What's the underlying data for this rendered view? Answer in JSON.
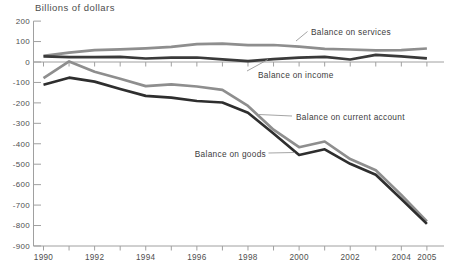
{
  "colors": {
    "background": "#ffffff",
    "axis": "#a0a0a0",
    "tick_label": "#4f4f4f",
    "title_text": "#4d4d4d",
    "annotation_text": "#3d3d3d",
    "pointer_line": "#9a9a9a"
  },
  "chart_data": {
    "type": "line",
    "title": "Billions of dollars",
    "xlabel": "",
    "ylabel": "Billions of dollars",
    "x": [
      1990,
      1991,
      1992,
      1993,
      1994,
      1995,
      1996,
      1997,
      1998,
      1999,
      2000,
      2001,
      2002,
      2003,
      2004,
      2005
    ],
    "x_tick_labels": [
      "1990",
      "1992",
      "1994",
      "1996",
      "1998",
      "2000",
      "2002",
      "2004",
      "2005"
    ],
    "y_tick_labels": [
      "200",
      "100",
      "0",
      "-100",
      "-200",
      "-300",
      "-400",
      "-500",
      "-600",
      "-700",
      "-800",
      "-900"
    ],
    "xlim": [
      1990,
      2005
    ],
    "ylim": [
      -900,
      200
    ],
    "grid": false,
    "zero_baseline": true,
    "legend_position": "inline-annotations",
    "series": [
      {
        "id": "balance-on-services",
        "name": "Balance on services",
        "color": "#8e8e8e",
        "values": [
          30,
          46,
          58,
          62,
          67,
          74,
          87,
          90,
          82,
          83,
          75,
          64,
          61,
          57,
          58,
          66
        ]
      },
      {
        "id": "balance-on-income",
        "name": "Balance on income",
        "color": "#3a3a3a",
        "values": [
          28,
          24,
          24,
          25,
          17,
          21,
          22,
          13,
          4,
          14,
          21,
          25,
          12,
          35,
          28,
          18
        ]
      },
      {
        "id": "balance-on-current-account",
        "name": "Balance on current account",
        "color": "#8e8e8e",
        "values": [
          -79,
          3,
          -48,
          -82,
          -118,
          -109,
          -120,
          -136,
          -215,
          -331,
          -417,
          -389,
          -475,
          -530,
          -650,
          -780
        ]
      },
      {
        "id": "balance-on-goods",
        "name": "Balance on goods",
        "color": "#2e2e2e",
        "values": [
          -111,
          -77,
          -96,
          -132,
          -166,
          -174,
          -191,
          -198,
          -248,
          -350,
          -455,
          -427,
          -498,
          -552,
          -670,
          -792
        ]
      }
    ],
    "annotations": [
      {
        "id": "balance-on-services",
        "label": "Balance on services",
        "text_x": 311,
        "text_y": 34.5,
        "anchor": "start",
        "line": [
          296,
          41,
          307.5,
          31.5
        ]
      },
      {
        "id": "balance-on-income",
        "label": "Balance on income",
        "text_x": 258,
        "text_y": 78,
        "anchor": "start",
        "line": [
          247,
          71,
          268,
          59.5
        ]
      },
      {
        "id": "balance-on-current-account",
        "label": "Balance on current account",
        "text_x": 296,
        "text_y": 119.5,
        "anchor": "start",
        "line": [
          292,
          116,
          259,
          114.5
        ]
      },
      {
        "id": "balance-on-goods",
        "label": "Balance on goods",
        "text_x": 266,
        "text_y": 156.5,
        "anchor": "end",
        "line": [
          268.5,
          153,
          294.5,
          152.5
        ]
      }
    ]
  }
}
